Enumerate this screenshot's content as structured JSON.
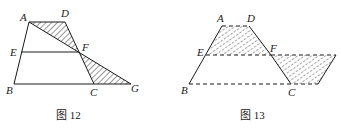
{
  "figures": [
    {
      "caption": "图 12",
      "labels": {
        "A": "A",
        "D": "D",
        "E": "E",
        "F": "F",
        "B": "B",
        "C": "C",
        "G": "G"
      },
      "points": {
        "A": [
          29,
          22
        ],
        "D": [
          65,
          22
        ],
        "E": [
          21,
          52
        ],
        "F": [
          79,
          52
        ],
        "B": [
          14,
          84
        ],
        "C": [
          94,
          84
        ],
        "G": [
          131,
          84
        ]
      },
      "shaded_regions": [
        "triangle ADF",
        "triangle FCG"
      ],
      "description": "Trapezoid ABCD with midline EF; AF extended meets BC extended at G; triangles ADF and GCF shaded"
    },
    {
      "caption": "图 13",
      "labels": {
        "A": "A",
        "D": "D",
        "E": "E",
        "F": "F",
        "B": "B",
        "C": "C"
      },
      "points": {
        "A": [
          222,
          26
        ],
        "D": [
          249,
          26
        ],
        "E": [
          206,
          55
        ],
        "F": [
          271,
          55
        ],
        "H": [
          336,
          55
        ],
        "B": [
          189,
          84
        ],
        "C": [
          291,
          84
        ],
        "K": [
          318,
          84
        ]
      },
      "shaded_regions": [
        "trapezoid AEFD",
        "parallelogram FHKC"
      ],
      "description": "Upper trapezoid AEFD cut along EF and rotated to form parallelogram; shaded pieces with dashed outlines"
    }
  ],
  "colors": {
    "stroke": "#1a1a1a",
    "hatch": "#1a1a1a",
    "background": "#ffffff"
  }
}
